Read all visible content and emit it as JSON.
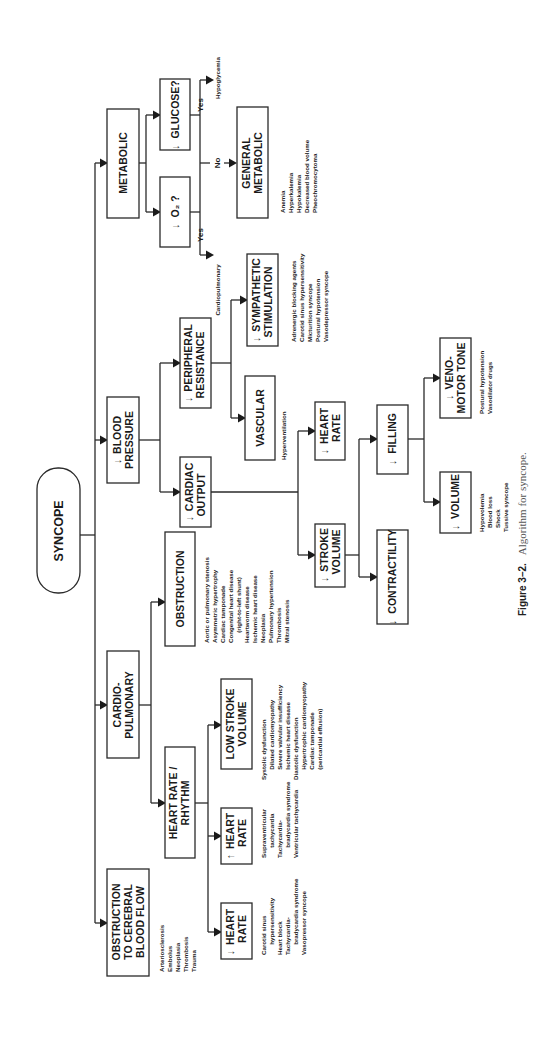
{
  "figure": {
    "caption_label": "Figure 3–2.",
    "caption_text": "Algorithm for syncope.",
    "orientation": "rotated 90° counter-clockwise"
  },
  "root": {
    "label": "SYNCOPE"
  },
  "nodes": {
    "metabolic": {
      "label": "METABOLIC"
    },
    "low_o2": {
      "arrow": "↓",
      "label": "O₂ ?"
    },
    "low_glucose": {
      "arrow": "↓",
      "label": "GLUCOSE?"
    },
    "general_metabolic": {
      "line1": "GENERAL",
      "line2": "METABOLIC",
      "causes": [
        "Anemia",
        "Hyperkalemia",
        "Hypokalemia",
        "Decreased blood volume",
        "Pheochromocytoma"
      ]
    },
    "o2_yes": {
      "label": "Yes",
      "result": "Cardiopulmonary"
    },
    "glucose_yes": {
      "label": "Yes",
      "result": "Hypoglycemia"
    },
    "no_branch": {
      "label": "No"
    },
    "blood_pressure": {
      "arrow": "↓",
      "line1": "BLOOD",
      "line2": "PRESSURE"
    },
    "peripheral_resistance": {
      "arrow": "↓",
      "line1": "PERIPHERAL",
      "line2": "RESISTANCE"
    },
    "sympathetic_stimulation": {
      "arrow": "↓",
      "line1": "SYMPATHETIC",
      "line2": "STIMULATION",
      "causes": [
        "Adrenergic blocking agents",
        "Carotid sinus hypersensitivity",
        "Micturition syncope",
        "Postural hypotension",
        "Vasodepressor syncope"
      ]
    },
    "vascular": {
      "label": "VASCULAR",
      "causes": [
        "Hyperventilation"
      ]
    },
    "cardiac_output": {
      "arrow": "↓",
      "line1": "CARDIAC",
      "line2": "OUTPUT"
    },
    "co_heart_rate": {
      "arrow": "↓",
      "line1": "HEART",
      "line2": "RATE"
    },
    "stroke_volume": {
      "arrow": "↓",
      "line1": "STROKE",
      "line2": "VOLUME"
    },
    "filling": {
      "arrow": "↓",
      "label": "FILLING"
    },
    "contractility": {
      "arrow": "↓",
      "label": "CONTRACTILITY"
    },
    "volume": {
      "arrow": "↓",
      "label": "VOLUME",
      "causes": [
        "Hypovolemia",
        "Blood loss",
        "Shock",
        "Tussive syncope"
      ]
    },
    "venomotor_tone": {
      "arrow": "↓",
      "line1": "VENO-",
      "line2": "MOTOR TONE",
      "causes": [
        "Postural hypotension",
        "Vasodilator drugs"
      ]
    },
    "cardiopulmonary": {
      "line1": "CARDIO-",
      "line2": "PULMONARY"
    },
    "obstruction": {
      "label": "OBSTRUCTION",
      "causes": [
        "Aortic or pulmonary stenosis",
        "Asymmetric hypertrophy",
        "Cardiac tamponade",
        "Congenital heart disease",
        "   (right-to-left shunt)",
        "Heartworm disease",
        "Ischemic heart disease",
        "Neoplasia",
        "Pulmonary hypertension",
        "Thrombosis",
        "Mitral stenosis"
      ]
    },
    "heart_rate_rhythm": {
      "line1": "HEART RATE /",
      "line2": "RHYTHM"
    },
    "low_stroke_volume": {
      "line1": "LOW STROKE",
      "line2": "VOLUME",
      "causes": [
        "Systolic dysfunction",
        "   Dilated cardiomyopathy",
        "   Severe valvular insufficiency",
        "   Ischemic heart disease",
        "Diastolic dysfunction",
        "   Hypertrophic cardiomyopathy",
        "   Cardiac tamponade",
        "   (pericardial effusion)"
      ]
    },
    "high_heart_rate": {
      "arrow": "↑",
      "line1": "HEART",
      "line2": "RATE",
      "causes": [
        "Supraventricular",
        "   tachycardia",
        "Tachycardia-",
        "   bradycardia syndrome",
        "Ventricular tachycardia"
      ]
    },
    "low_heart_rate": {
      "arrow": "↓",
      "line1": "HEART",
      "line2": "RATE",
      "causes": [
        "Carotid sinus",
        "   hypersensitivity",
        "Heart block",
        "Tachycardia-",
        "   bradycardia syndrome",
        "Vasopressor syncope"
      ]
    },
    "cerebral_obstruction": {
      "line1": "OBSTRUCTION",
      "line2": "TO CEREBRAL",
      "line3": "BLOOD FLOW",
      "causes": [
        "Arteriosclerosis",
        "Embolus",
        "Neoplasia",
        "Thrombosis",
        "Trauma"
      ]
    }
  }
}
